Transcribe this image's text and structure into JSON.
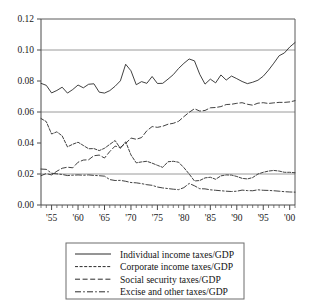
{
  "chart_data": {
    "type": "line",
    "title": "",
    "xlabel": "",
    "ylabel": "",
    "xlim": [
      1953,
      2001
    ],
    "ylim": [
      0.0,
      0.12
    ],
    "grid": true,
    "gridlines_at": [
      0.02,
      0.06,
      0.1
    ],
    "legend_position": "below-plot",
    "ytick_labels": [
      "0.00",
      "0.02",
      "0.04",
      "0.06",
      "0.08",
      "0.10",
      "0.12"
    ],
    "ytick_values": [
      0.0,
      0.02,
      0.04,
      0.06,
      0.08,
      0.1,
      0.12
    ],
    "xtick_labels": [
      "'55",
      "'60",
      "'65",
      "'70",
      "'75",
      "'80",
      "'85",
      "'90",
      "'95",
      "'00"
    ],
    "xtick_values": [
      1955,
      1960,
      1965,
      1970,
      1975,
      1980,
      1985,
      1990,
      1995,
      2000
    ],
    "x": [
      1953,
      1954,
      1955,
      1956,
      1957,
      1958,
      1959,
      1960,
      1961,
      1962,
      1963,
      1964,
      1965,
      1966,
      1967,
      1968,
      1969,
      1970,
      1971,
      1972,
      1973,
      1974,
      1975,
      1976,
      1977,
      1978,
      1979,
      1980,
      1981,
      1982,
      1983,
      1984,
      1985,
      1986,
      1987,
      1988,
      1989,
      1990,
      1991,
      1992,
      1993,
      1994,
      1995,
      1996,
      1997,
      1998,
      1999,
      2000,
      2001
    ],
    "series": [
      {
        "name": "Individual income taxes/GDP",
        "style": "solid",
        "values": [
          0.0785,
          0.0772,
          0.0723,
          0.0739,
          0.076,
          0.0722,
          0.0745,
          0.0774,
          0.0756,
          0.0779,
          0.0782,
          0.0728,
          0.0722,
          0.0738,
          0.0766,
          0.0801,
          0.0908,
          0.0866,
          0.0776,
          0.0796,
          0.0785,
          0.0829,
          0.0784,
          0.0785,
          0.0812,
          0.0841,
          0.0881,
          0.0914,
          0.0942,
          0.093,
          0.0843,
          0.078,
          0.0812,
          0.0788,
          0.0839,
          0.0806,
          0.0832,
          0.0815,
          0.0797,
          0.0783,
          0.0792,
          0.0805,
          0.0831,
          0.087,
          0.0915,
          0.0963,
          0.0981,
          0.1019,
          0.1048
        ]
      },
      {
        "name": "Corporate income taxes/GDP",
        "style": "dotted",
        "values": [
          0.0558,
          0.0538,
          0.0458,
          0.0472,
          0.0446,
          0.0375,
          0.0392,
          0.0405,
          0.0384,
          0.0363,
          0.0364,
          0.0351,
          0.0366,
          0.0391,
          0.0416,
          0.0365,
          0.0408,
          0.0323,
          0.0272,
          0.0278,
          0.0282,
          0.027,
          0.0256,
          0.0243,
          0.0279,
          0.0282,
          0.0276,
          0.0241,
          0.02,
          0.0155,
          0.0158,
          0.0175,
          0.0179,
          0.0166,
          0.0188,
          0.0194,
          0.0193,
          0.0184,
          0.0172,
          0.0168,
          0.0177,
          0.02,
          0.0211,
          0.0219,
          0.0223,
          0.0219,
          0.0211,
          0.0211,
          0.0208
        ]
      },
      {
        "name": "Social security taxes/GDP",
        "style": "dashed",
        "values": [
          0.0189,
          0.0203,
          0.0194,
          0.0218,
          0.0237,
          0.0244,
          0.024,
          0.0276,
          0.029,
          0.0292,
          0.0318,
          0.0322,
          0.0303,
          0.0345,
          0.038,
          0.0372,
          0.0397,
          0.0432,
          0.0424,
          0.0435,
          0.0479,
          0.0506,
          0.0501,
          0.0508,
          0.0521,
          0.0527,
          0.054,
          0.057,
          0.0598,
          0.0621,
          0.0606,
          0.061,
          0.0627,
          0.0629,
          0.0635,
          0.0648,
          0.065,
          0.0656,
          0.066,
          0.065,
          0.0644,
          0.0657,
          0.066,
          0.0655,
          0.0659,
          0.0662,
          0.0662,
          0.0665,
          0.0673
        ]
      },
      {
        "name": "Excise and other taxes/GDP",
        "style": "dashdot",
        "values": [
          0.0232,
          0.023,
          0.0205,
          0.0201,
          0.0197,
          0.019,
          0.0192,
          0.0194,
          0.0192,
          0.0194,
          0.0191,
          0.0189,
          0.0186,
          0.0164,
          0.0158,
          0.0159,
          0.0153,
          0.0145,
          0.0143,
          0.0138,
          0.0131,
          0.0127,
          0.0116,
          0.011,
          0.0106,
          0.0102,
          0.0099,
          0.0112,
          0.0139,
          0.0124,
          0.0105,
          0.0104,
          0.0098,
          0.0095,
          0.0092,
          0.0089,
          0.0087,
          0.0089,
          0.0096,
          0.0093,
          0.0092,
          0.0098,
          0.0095,
          0.0094,
          0.0092,
          0.0089,
          0.0086,
          0.0084,
          0.0083
        ]
      }
    ]
  },
  "legend": {
    "entries": [
      {
        "label": "Individual income taxes/GDP",
        "style": "solid"
      },
      {
        "label": "Corporate income taxes/GDP",
        "style": "dotted"
      },
      {
        "label": "Social security taxes/GDP",
        "style": "dashed"
      },
      {
        "label": "Excise and other taxes/GDP",
        "style": "dashdot"
      }
    ]
  }
}
